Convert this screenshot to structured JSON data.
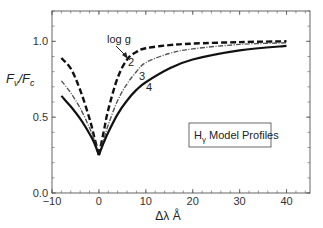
{
  "chart_data": {
    "type": "line",
    "title": "",
    "xlabel": "Δλ  Å",
    "ylabel": "F_ν/F_c",
    "xlim": [
      -10,
      45
    ],
    "ylim": [
      0,
      1.2
    ],
    "xticks": [
      -10,
      0,
      10,
      20,
      30,
      40
    ],
    "yticks": [
      0.0,
      0.5,
      1.0
    ],
    "xtick_labels": [
      "−10",
      "0",
      "10",
      "20",
      "30",
      "40"
    ],
    "ytick_labels": [
      "0.0",
      "0.5",
      "1.0"
    ],
    "grid": false,
    "legend_box": "Hγ Model Profiles",
    "annotations": [
      {
        "text": "log g",
        "x": 4.5,
        "y": 1.02,
        "arrow_to": [
          6.3,
          0.9
        ]
      },
      {
        "text": "2",
        "x": 6.5,
        "y": 0.86
      },
      {
        "text": "3",
        "x": 9.5,
        "y": 0.78
      },
      {
        "text": "4",
        "x": 11.5,
        "y": 0.69
      }
    ],
    "series": [
      {
        "name": "log g = 2",
        "style": "dashed",
        "x": [
          -8,
          -6,
          -4,
          -2,
          -1,
          0,
          1,
          2,
          4,
          6,
          8,
          10,
          15,
          20,
          30,
          40
        ],
        "y": [
          0.89,
          0.82,
          0.68,
          0.49,
          0.37,
          0.25,
          0.4,
          0.55,
          0.76,
          0.88,
          0.93,
          0.955,
          0.975,
          0.985,
          0.995,
          1.0
        ]
      },
      {
        "name": "log g = 3",
        "style": "dash-dot",
        "x": [
          -8,
          -6,
          -4,
          -2,
          -1,
          0,
          1,
          2,
          4,
          6,
          8,
          10,
          15,
          20,
          30,
          40
        ],
        "y": [
          0.74,
          0.66,
          0.56,
          0.43,
          0.35,
          0.25,
          0.35,
          0.45,
          0.61,
          0.72,
          0.8,
          0.86,
          0.92,
          0.95,
          0.98,
          0.99
        ]
      },
      {
        "name": "log g = 4",
        "style": "solid",
        "x": [
          -8,
          -6,
          -4,
          -2,
          -1,
          0,
          1,
          2,
          4,
          6,
          8,
          10,
          15,
          20,
          30,
          40
        ],
        "y": [
          0.64,
          0.57,
          0.49,
          0.39,
          0.33,
          0.25,
          0.33,
          0.4,
          0.52,
          0.61,
          0.68,
          0.73,
          0.82,
          0.88,
          0.94,
          0.97
        ]
      }
    ]
  },
  "labels": {
    "ylabel_main": "F",
    "ylabel_sub1": "ν",
    "ylabel_slash": "/F",
    "ylabel_sub2": "c",
    "xlabel": "Δλ  Å",
    "legend_main": "H",
    "legend_sub": "γ",
    "legend_rest": " Model Profiles",
    "logg": "log g",
    "c2": "2",
    "c3": "3",
    "c4": "4"
  }
}
